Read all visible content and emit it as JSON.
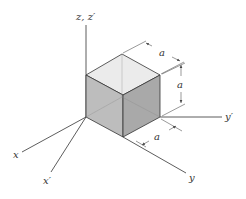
{
  "diagram": {
    "type": "isometric-cube-with-axes",
    "colors": {
      "background": "#ffffff",
      "line": "#333333",
      "top_face": "#ebebeb",
      "left_face": "#bdbdbd",
      "right_face": "#a9a9a9",
      "dim_line": "#555555"
    },
    "axes": {
      "z": {
        "label": "z, z′"
      },
      "x": {
        "label": "x"
      },
      "x_prime": {
        "label": "x′"
      },
      "y": {
        "label": "y"
      },
      "y_prime": {
        "label": "y′"
      }
    },
    "dimensions": {
      "top_edge": {
        "label": "a"
      },
      "vertical_edge": {
        "label": "a"
      },
      "bottom_edge": {
        "label": "a"
      }
    }
  }
}
